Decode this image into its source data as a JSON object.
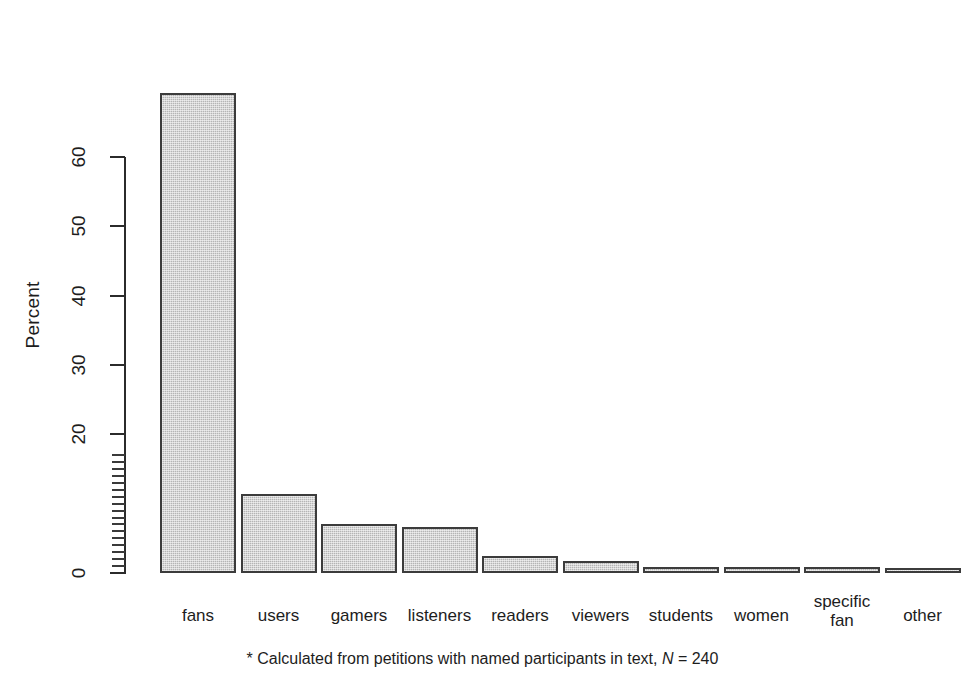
{
  "chart_data": {
    "type": "bar",
    "title": "",
    "xlabel": "",
    "ylabel": "Percent",
    "categories": [
      "fans",
      "users",
      "gamers",
      "listeners",
      "readers",
      "viewers",
      "students",
      "women",
      "specific fan",
      "other"
    ],
    "values": [
      69.2,
      11.4,
      7.1,
      6.7,
      2.5,
      1.7,
      0.8,
      0.8,
      0.8,
      0.4
    ],
    "ylim": [
      0,
      69.5
    ],
    "y_major_ticks": [
      0,
      20,
      30,
      40,
      50,
      60
    ],
    "y_minor_ticks": [
      1,
      2,
      3,
      4,
      5,
      6,
      7,
      8,
      9,
      10,
      11,
      12,
      13,
      14,
      15,
      16,
      17
    ],
    "grid": false,
    "legend": null,
    "annotations": [
      "* Calculated from petitions with named participants in text, N = 240"
    ],
    "bar_fill_color": "#b5b5b5",
    "bar_border_color": "#3c3c3c",
    "background_color": "#ffffff"
  },
  "axes": {
    "y_title": "Percent",
    "y_tick_labels": [
      "0",
      "20",
      "30",
      "40",
      "50",
      "60"
    ]
  },
  "x_axis": {
    "labels": [
      {
        "line1": "fans",
        "line2": ""
      },
      {
        "line1": "users",
        "line2": ""
      },
      {
        "line1": "gamers",
        "line2": ""
      },
      {
        "line1": "listeners",
        "line2": ""
      },
      {
        "line1": "readers",
        "line2": ""
      },
      {
        "line1": "viewers",
        "line2": ""
      },
      {
        "line1": "students",
        "line2": ""
      },
      {
        "line1": "women",
        "line2": ""
      },
      {
        "line1": "specific",
        "line2": "fan"
      },
      {
        "line1": "other",
        "line2": ""
      }
    ]
  },
  "footnote": {
    "marker": "*",
    "text": " Calculated from petitions with named participants in text, ",
    "n_symbol": "N",
    "n_value": " = 240"
  }
}
